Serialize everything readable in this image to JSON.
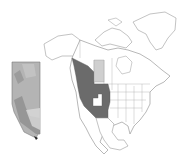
{
  "map": {
    "description": "North America outline map with highlighted western region and Alberta inset",
    "colors": {
      "background": "#ffffff",
      "outline": "#9a9a9a",
      "highlight_dark": "#6b6b6b",
      "highlight_light": "#cfcfcf",
      "inset_fill": "#b4b4b4",
      "inset_dark": "#8f8f8f",
      "inset_light": "#d9d9d9"
    },
    "regions": [
      {
        "name": "British Columbia / Western US",
        "shade": "dark"
      },
      {
        "name": "Alberta",
        "shade": "light"
      },
      {
        "name": "Utah",
        "shade": "white"
      }
    ],
    "inset": {
      "name": "Alberta"
    }
  }
}
